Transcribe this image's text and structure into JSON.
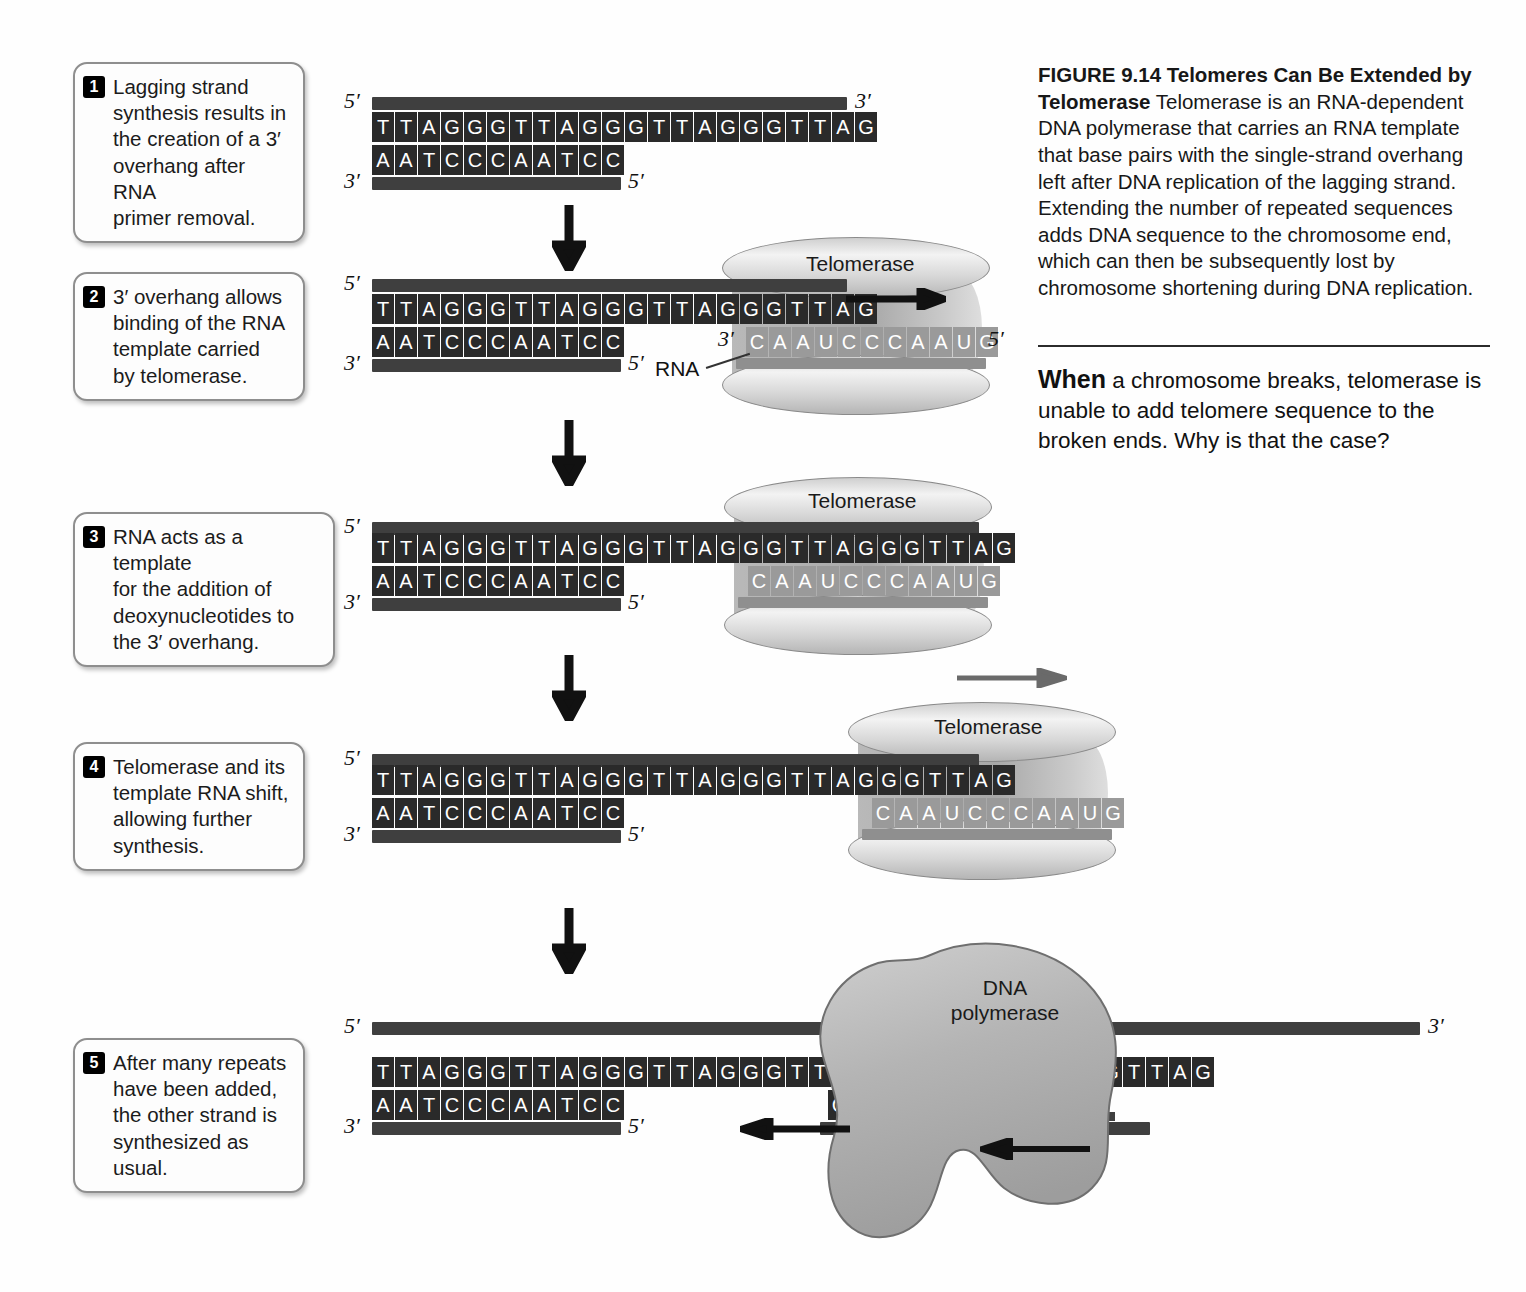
{
  "figure": {
    "number": "FIGURE 9.14",
    "title": "Telomeres Can Be Extended by Telomerase",
    "body": "Telomerase is an RNA-dependent DNA polymerase that carries an RNA template that base pairs with the single-strand overhang left after DNA replication of the lagging strand. Extending the number of repeated sequences adds DNA sequence to the chromosome end, which can then be subsequently lost by chromosome shortening during DNA replication.",
    "question_lead": "When",
    "question_rest": " a chromosome breaks, telomerase is unable to add telomere sequence to the broken ends. Why is that the case?"
  },
  "labels": {
    "telomerase": "Telomerase",
    "rna": "RNA",
    "dna_polymerase": "DNA\npolymerase",
    "five_prime": "5′",
    "three_prime": "3′"
  },
  "steps": [
    {
      "num": "1",
      "text": "Lagging strand\nsynthesis results in\nthe creation of a 3′\noverhang after RNA\nprimer removal."
    },
    {
      "num": "2",
      "text": "3′ overhang allows\nbinding of the RNA\ntemplate carried\nby telomerase."
    },
    {
      "num": "3",
      "text": "RNA acts as a template\nfor the addition of\ndeoxynucleotides to\nthe 3′ overhang."
    },
    {
      "num": "4",
      "text": "Telomerase and its\ntemplate RNA shift,\nallowing further\nsynthesis."
    },
    {
      "num": "5",
      "text": "After many repeats\nhave been added,\nthe other strand is\nsynthesized as usual."
    }
  ],
  "panels": [
    {
      "id": "panel-1",
      "top_strand": "TTAGGGTTAGGGTTAGGGTTAG",
      "bottom_strand": "AATCCCAATCC",
      "rna_strand": "",
      "top_left_label": "5′",
      "top_right_label": "3′",
      "bottom_left_label": "3′",
      "bottom_right_label": "5′"
    },
    {
      "id": "panel-2",
      "top_strand": "TTAGGGTTAGGGTTAGGGTTAG",
      "bottom_strand": "AATCCCAATCC",
      "rna_strand": "CAAUCCCAAUG",
      "rna_left_label": "3′",
      "rna_right_label": "5′",
      "top_left_label": "5′",
      "bottom_left_label": "3′",
      "bottom_right_label": "5′"
    },
    {
      "id": "panel-3",
      "top_strand": "TTAGGGTTAGGGTTAGGGTTAGGGTTAG",
      "bottom_strand": "AATCCCAATCC",
      "rna_strand": "CAAUCCCAAUG",
      "top_left_label": "5′",
      "bottom_left_label": "3′",
      "bottom_right_label": "5′"
    },
    {
      "id": "panel-4",
      "top_strand": "TTAGGGTTAGGGTTAGGGTTAGGGTTAG",
      "bottom_strand": "AATCCCAATCC",
      "rna_strand": "CAAUCCCAAUG",
      "top_left_label": "5′",
      "bottom_left_label": "3′",
      "bottom_right_label": "5′"
    },
    {
      "id": "panel-5",
      "top_strand": "TTAGGGTTAGGGTTAGGGTTAGGG",
      "top_strand_right": "GTTAG",
      "bottom_strand": "AATCCCAATCC",
      "new_strand": "CCCAG",
      "top_left_label": "5′",
      "top_right_label": "3′",
      "bottom_left_label": "3′",
      "bottom_right_label": "5′"
    }
  ],
  "colors": {
    "base_fill": "#2a2a2a",
    "rna_fill": "#9a9a9a",
    "backbone": "#3f3f3f",
    "protein": "#c6c6c6"
  }
}
